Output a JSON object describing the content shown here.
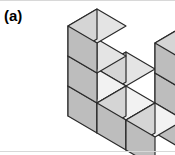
{
  "figure": {
    "label": "(a)",
    "caption_alt": "Isometric stack of unit cubes forming a U shape",
    "background_color": "#ffffff",
    "rule_color": "#d8d8d8"
  },
  "solid": {
    "shape_name": "U-shaped cube stack",
    "cube_count": 9,
    "projection": "isometric",
    "cell_width": 29,
    "cell_height": 17,
    "cell_rise": 30,
    "origin_x": 68,
    "origin_y": 116,
    "cubes": [
      {
        "name": "left-column-bottom",
        "x": 0,
        "y": 0,
        "z": 0
      },
      {
        "name": "left-column-middle",
        "x": 0,
        "y": 0,
        "z": 1
      },
      {
        "name": "left-column-top",
        "x": 0,
        "y": 0,
        "z": 2
      },
      {
        "name": "front-left-base",
        "x": 1,
        "y": 0,
        "z": 0
      },
      {
        "name": "front-middle-base",
        "x": 2,
        "y": 0,
        "z": 0
      },
      {
        "name": "right-column-bottom",
        "x": 2,
        "y": 1,
        "z": 0
      },
      {
        "name": "right-column-middle",
        "x": 2,
        "y": 1,
        "z": 1
      },
      {
        "name": "right-column-top",
        "x": 2,
        "y": 1,
        "z": 2
      },
      {
        "name": "back-left-base",
        "x": 0,
        "y": 1,
        "z": 0
      }
    ],
    "face_colors": {
      "top_bright": "#f2f2f2",
      "top_shadow": "#e4e4e4",
      "left": "#d5d5d5",
      "right": "#bdbdbd",
      "edge": "#2b2b2b"
    },
    "edge_width": 1.2
  }
}
